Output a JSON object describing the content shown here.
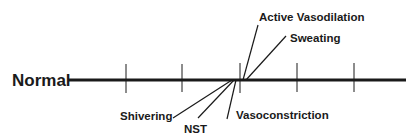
{
  "diagram": {
    "baseline_label": "Normal",
    "colors": {
      "ink": "#1a1a1a",
      "background": "#ffffff"
    },
    "baseline": {
      "x1": 68,
      "x2": 406,
      "y": 80
    },
    "ticks": [
      126,
      182,
      240,
      297,
      354
    ],
    "responses_above": [
      {
        "label": "Active Vasodilation",
        "line": [
          243,
          80,
          258,
          25
        ]
      },
      {
        "label": "Sweating",
        "line": [
          247,
          80,
          286,
          36
        ]
      }
    ],
    "responses_below": [
      {
        "label": "Shivering",
        "line": [
          232,
          80,
          173,
          118
        ]
      },
      {
        "label": "NST",
        "line": [
          234,
          80,
          198,
          118
        ]
      },
      {
        "label": "Vasoconstriction",
        "line": [
          236,
          80,
          227,
          119
        ]
      }
    ]
  }
}
